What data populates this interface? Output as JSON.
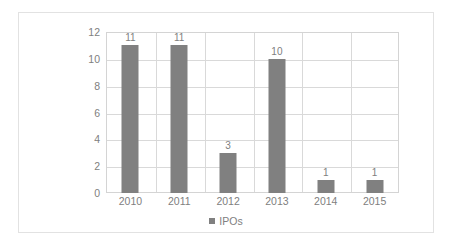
{
  "chart_data": {
    "type": "bar",
    "title": "",
    "subtitle": "",
    "xlabel": "",
    "ylabel": "",
    "categories": [
      "2010",
      "2011",
      "2012",
      "2013",
      "2014",
      "2015"
    ],
    "values": [
      11,
      11,
      3,
      10,
      1,
      1
    ],
    "series": [
      {
        "name": "IPOs",
        "values": [
          11,
          11,
          3,
          10,
          1,
          1
        ],
        "color": "#808080"
      }
    ],
    "data_labels": [
      "11",
      "11",
      "3",
      "10",
      "1",
      "1"
    ],
    "ylim": [
      0,
      12
    ],
    "ytick_values": [
      0,
      2,
      4,
      6,
      8,
      10,
      12
    ],
    "ytick_labels": [
      "0",
      "2",
      "4",
      "6",
      "8",
      "10",
      "12"
    ],
    "grid": "horizontal-and-vertical",
    "legend": {
      "position": "bottom-center",
      "entries": [
        {
          "label": "IPOs",
          "color": "#808080"
        }
      ]
    }
  },
  "colors": {
    "bar": "#808080",
    "gridline": "#d9d9d9",
    "plot_border": "#d4d4d4",
    "frame_border": "#e2e2e2",
    "text": "#808080",
    "background": "#ffffff"
  }
}
